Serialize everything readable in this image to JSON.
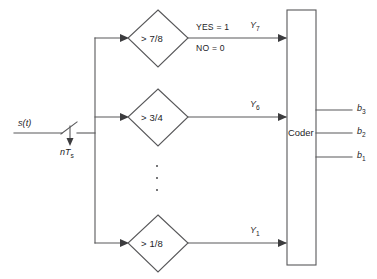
{
  "diagram": {
    "input": {
      "signal_label": "s(t)",
      "sampler_label": "nT",
      "sampler_sub": "s",
      "sampler_icon": "switch-sampler-icon"
    },
    "annotations": {
      "yes": "YES = 1",
      "no": "NO = 0",
      "ellipsis": "vertical-ellipsis"
    },
    "comparators": [
      {
        "id": "cmp-7-8",
        "threshold": "> 7/8",
        "output_label": "Y",
        "output_sub": "7"
      },
      {
        "id": "cmp-3-4",
        "threshold": "> 3/4",
        "output_label": "Y",
        "output_sub": "6"
      },
      {
        "id": "cmp-1-8",
        "threshold": "> 1/8",
        "output_label": "Y",
        "output_sub": "1"
      }
    ],
    "coder": {
      "label": "Coder"
    },
    "outputs": [
      {
        "label": "b",
        "sub": "3"
      },
      {
        "label": "b",
        "sub": "2"
      },
      {
        "label": "b",
        "sub": "1"
      }
    ],
    "colors": {
      "line": "#58585a",
      "text": "#1d1d1f",
      "background": "#ffffff"
    }
  }
}
